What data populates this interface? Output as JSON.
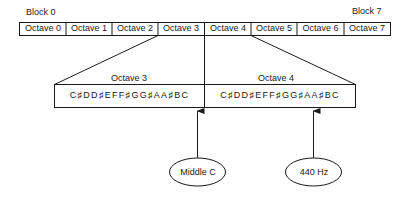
{
  "blocks": {
    "start_label": "Block 0",
    "end_label": "Block 7"
  },
  "octave_row": [
    "Octave 0",
    "Octave 1",
    "Octave 2",
    "Octave 3",
    "Octave 4",
    "Octave 5",
    "Octave 6",
    "Octave 7"
  ],
  "expanded": {
    "left": {
      "title": "Octave 3",
      "notes": "C♯DD♯EFF♯GG♯AA♯BC"
    },
    "right": {
      "title": "Octave 4",
      "notes": "C♯DD♯EFF♯GG♯AA♯BC"
    }
  },
  "callouts": {
    "middle_c": "Middle C",
    "a440": "440 Hz"
  },
  "colors": {
    "line": "#1a1a1a",
    "background": "#ffffff"
  }
}
